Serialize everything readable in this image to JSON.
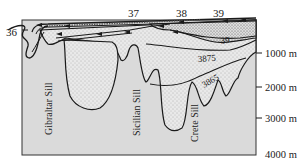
{
  "diagram": {
    "stations": [
      {
        "label": "36",
        "x": 14,
        "y": 32
      },
      {
        "label": "37",
        "x": 118,
        "y": 17
      },
      {
        "label": "38",
        "x": 177,
        "y": 17
      },
      {
        "label": "39",
        "x": 215,
        "y": 17
      }
    ],
    "sills": [
      {
        "label": "Gibraltar Sill"
      },
      {
        "label": "Sicilian Sill"
      },
      {
        "label": "Crete Sill"
      }
    ],
    "isolines": [
      {
        "label": "39"
      },
      {
        "label": "3875"
      },
      {
        "label": "3865"
      }
    ],
    "depth_axis": {
      "ticks": [
        "1000 m",
        "2000 m",
        "3000 m",
        "4000 m"
      ]
    },
    "colors": {
      "land": "#d9d9d9",
      "water_dense": "#e6e6e6",
      "outline": "#1a1a1a",
      "background": "#ffffff"
    }
  }
}
